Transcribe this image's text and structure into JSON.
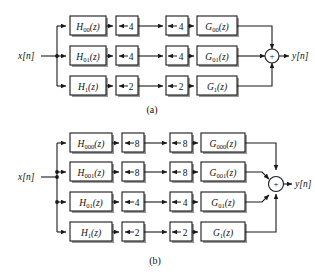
{
  "figure": {
    "background_color": "#ffffff",
    "line_color": "#1a1a1a",
    "shadow_color": "#9a9a9a",
    "panels": [
      {
        "id": "panel-a",
        "caption": "(a)",
        "input_label": "x[n]",
        "output_label": "y[n]",
        "sum_symbol": "+",
        "branches": [
          {
            "index": 0,
            "analysis_filter": {
              "base": "H",
              "sub": "00",
              "arg": "(z)",
              "full": "H00(z)"
            },
            "downsampler": {
              "arrow": "down",
              "factor": "4",
              "full": "↓4"
            },
            "upsampler": {
              "arrow": "up",
              "factor": "4",
              "full": "↑4"
            },
            "synthesis_filter": {
              "base": "G",
              "sub": "00",
              "arg": "(z)",
              "full": "G00(z)"
            }
          },
          {
            "index": 1,
            "analysis_filter": {
              "base": "H",
              "sub": "01",
              "arg": "(z)",
              "full": "H01(z)"
            },
            "downsampler": {
              "arrow": "down",
              "factor": "4",
              "full": "↓4"
            },
            "upsampler": {
              "arrow": "up",
              "factor": "4",
              "full": "↑4"
            },
            "synthesis_filter": {
              "base": "G",
              "sub": "01",
              "arg": "(z)",
              "full": "G01(z)"
            }
          },
          {
            "index": 2,
            "analysis_filter": {
              "base": "H",
              "sub": "1",
              "arg": "(z)",
              "full": "H1(z)"
            },
            "downsampler": {
              "arrow": "down",
              "factor": "2",
              "full": "↓2"
            },
            "upsampler": {
              "arrow": "up",
              "factor": "2",
              "full": "↑2"
            },
            "synthesis_filter": {
              "base": "G",
              "sub": "1",
              "arg": "(z)",
              "full": "G1(z)"
            }
          }
        ]
      },
      {
        "id": "panel-b",
        "caption": "(b)",
        "input_label": "x[n]",
        "output_label": "y[n]",
        "sum_symbol": "+",
        "branches": [
          {
            "index": 0,
            "analysis_filter": {
              "base": "H",
              "sub": "000",
              "arg": "(z)",
              "full": "H000(z)"
            },
            "downsampler": {
              "arrow": "down",
              "factor": "8",
              "full": "↓8"
            },
            "upsampler": {
              "arrow": "up",
              "factor": "8",
              "full": "↑8"
            },
            "synthesis_filter": {
              "base": "G",
              "sub": "000",
              "arg": "(z)",
              "full": "G000(z)"
            }
          },
          {
            "index": 1,
            "analysis_filter": {
              "base": "H",
              "sub": "001",
              "arg": "(z)",
              "full": "H001(z)"
            },
            "downsampler": {
              "arrow": "down",
              "factor": "8",
              "full": "↓8"
            },
            "upsampler": {
              "arrow": "up",
              "factor": "8",
              "full": "↑8"
            },
            "synthesis_filter": {
              "base": "G",
              "sub": "001",
              "arg": "(z)",
              "full": "G001(z)"
            }
          },
          {
            "index": 2,
            "analysis_filter": {
              "base": "H",
              "sub": "01",
              "arg": "(z)",
              "full": "H01(z)"
            },
            "downsampler": {
              "arrow": "down",
              "factor": "4",
              "full": "↓4"
            },
            "upsampler": {
              "arrow": "up",
              "factor": "4",
              "full": "↑4"
            },
            "synthesis_filter": {
              "base": "G",
              "sub": "01",
              "arg": "(z)",
              "full": "G01(z)"
            }
          },
          {
            "index": 3,
            "analysis_filter": {
              "base": "H",
              "sub": "1",
              "arg": "(z)",
              "full": "H1(z)"
            },
            "downsampler": {
              "arrow": "down",
              "factor": "2",
              "full": "↓2"
            },
            "upsampler": {
              "arrow": "up",
              "factor": "2",
              "full": "↑2"
            },
            "synthesis_filter": {
              "base": "G",
              "sub": "1",
              "arg": "(z)",
              "full": "G1(z)"
            }
          }
        ]
      }
    ]
  }
}
